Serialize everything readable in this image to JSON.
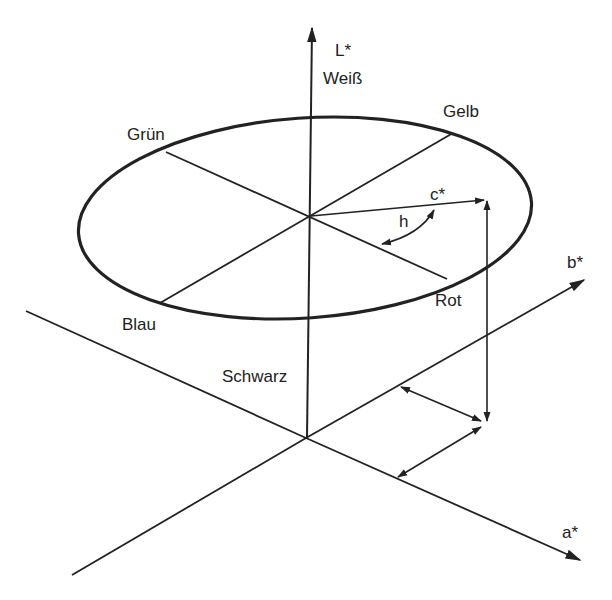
{
  "diagram": {
    "type": "CIE L*a*b* / L*C*h color space illustration",
    "labels": {
      "l_axis": "L*",
      "white": "Weiß",
      "black": "Schwarz",
      "a_axis": "a*",
      "b_axis": "b*",
      "chroma": "c*",
      "hue": "h",
      "green": "Grün",
      "yellow": "Gelb",
      "blue": "Blau",
      "red": "Rot"
    },
    "colors": {
      "line": "#222222",
      "background": "#ffffff"
    }
  }
}
